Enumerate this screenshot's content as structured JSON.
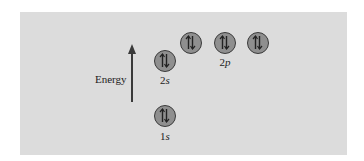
{
  "diagram": {
    "title": "",
    "axis_label": "Energy",
    "colors": {
      "background": "#dcdcdc",
      "orbital_fill": "#8f8f8f",
      "orbital_stroke": "#3a3a3a",
      "arrow": "#3a3a3a"
    },
    "orbitals": [
      {
        "id": "1s",
        "level": "1",
        "sublevel": "s",
        "electrons": 2,
        "spins": [
          "up",
          "down"
        ],
        "label_num": "1",
        "label_letter": "s"
      },
      {
        "id": "2s",
        "level": "2",
        "sublevel": "s",
        "electrons": 2,
        "spins": [
          "up",
          "down"
        ],
        "label_num": "2",
        "label_letter": "s"
      },
      {
        "id": "2p_1",
        "level": "2",
        "sublevel": "p",
        "electrons": 2,
        "spins": [
          "up",
          "down"
        ]
      },
      {
        "id": "2p_2",
        "level": "2",
        "sublevel": "p",
        "electrons": 2,
        "spins": [
          "up",
          "down"
        ]
      },
      {
        "id": "2p_3",
        "level": "2",
        "sublevel": "p",
        "electrons": 2,
        "spins": [
          "up",
          "down"
        ]
      }
    ],
    "labels": {
      "s1_num": "1",
      "s1_letter": "s",
      "s2_num": "2",
      "s2_letter": "s",
      "p2_num": "2",
      "p2_letter": "p"
    }
  }
}
